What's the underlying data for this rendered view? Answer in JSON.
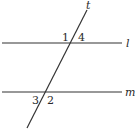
{
  "diagram": {
    "title": "",
    "lines": [
      {
        "id": "l",
        "label": "l",
        "x1": 2,
        "y1": 43,
        "x2": 122,
        "y2": 43
      },
      {
        "id": "m",
        "label": "m",
        "x1": 2,
        "y1": 92,
        "x2": 122,
        "y2": 92
      },
      {
        "id": "t",
        "label": "t",
        "x1": 87,
        "y1": 10,
        "x2": 27,
        "y2": 128
      }
    ],
    "line_labels": {
      "t": "t",
      "l": "l",
      "m": "m"
    },
    "angle_labels": {
      "a1": "1",
      "a4": "4",
      "a3": "3",
      "a2": "2"
    },
    "colors": {
      "stroke": "#333333",
      "text": "#2a2a2a",
      "background": "#ffffff"
    }
  }
}
